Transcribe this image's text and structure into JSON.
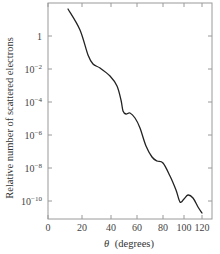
{
  "chart_data": {
    "type": "line",
    "title": "",
    "xlabel": "θ (degrees)",
    "xlabel_symbol": "θ",
    "xlabel_unit": "(degrees)",
    "ylabel": "Relative number of scattered electrons",
    "yscale": "log",
    "xscale": "nonlinear",
    "xlim": [
      0,
      125
    ],
    "ylim": [
      1e-11,
      100
    ],
    "grid": false,
    "legend": null,
    "x_ticks": [
      0,
      20,
      40,
      60,
      80,
      100,
      120
    ],
    "x_tick_labels": [
      "0",
      "20",
      "40",
      "60",
      "80",
      "100",
      "120"
    ],
    "x_tick_px": [
      48,
      82,
      111,
      137,
      163,
      184,
      202
    ],
    "y_ticks": [
      1,
      0.01,
      0.0001,
      1e-06,
      1e-08,
      1e-10
    ],
    "y_tick_labels": [
      {
        "base": "1",
        "exp": ""
      },
      {
        "base": "10",
        "exp": "−2"
      },
      {
        "base": "10",
        "exp": "−4"
      },
      {
        "base": "10",
        "exp": "−6"
      },
      {
        "base": "10",
        "exp": "−8"
      },
      {
        "base": "10",
        "exp": "−10"
      }
    ],
    "series": [
      {
        "name": "scattered electrons",
        "color": "#222222",
        "x": [
          12,
          18,
          22,
          25,
          30,
          36,
          42,
          45,
          47,
          49,
          52,
          56,
          60,
          64,
          69,
          73,
          80,
          85,
          90,
          95,
          100,
          104,
          110,
          116,
          120
        ],
        "log10_y": [
          1.64,
          0.36,
          -1.15,
          -1.7,
          -1.94,
          -2.42,
          -3.03,
          -3.88,
          -4.55,
          -4.73,
          -4.67,
          -4.97,
          -5.58,
          -6.67,
          -7.33,
          -7.58,
          -7.7,
          -8.48,
          -9.33,
          -10.06,
          -9.88,
          -9.64,
          -9.82,
          -10.36,
          -10.73
        ],
        "y": [
          43.6,
          2.3,
          0.071,
          0.02,
          0.0115,
          0.0038,
          0.00093,
          0.00013,
          2.8e-05,
          1.9e-05,
          2.1e-05,
          1.1e-05,
          2.6e-06,
          2.1e-07,
          4.7e-08,
          2.6e-08,
          2e-08,
          3.3e-09,
          4.7e-10,
          8.7e-11,
          1.3e-10,
          2.3e-10,
          1.5e-10,
          4.4e-11,
          1.9e-11
        ]
      }
    ],
    "curve_px": [
      [
        68,
        9
      ],
      [
        80,
        30
      ],
      [
        88,
        55
      ],
      [
        93,
        64
      ],
      [
        100,
        68
      ],
      [
        110,
        76
      ],
      [
        117,
        86
      ],
      [
        121,
        100
      ],
      [
        123,
        111
      ],
      [
        126,
        114
      ],
      [
        130,
        113
      ],
      [
        135,
        118
      ],
      [
        140,
        128
      ],
      [
        146,
        146
      ],
      [
        152,
        157
      ],
      [
        157,
        161
      ],
      [
        163,
        163
      ],
      [
        170,
        176
      ],
      [
        176,
        190
      ],
      [
        180,
        202
      ],
      [
        184,
        199
      ],
      [
        188,
        195
      ],
      [
        193,
        198
      ],
      [
        198,
        207
      ],
      [
        202,
        213
      ]
    ]
  },
  "colors": {
    "frame": "#9a9a9a",
    "curve": "#222222",
    "text": "#444444"
  }
}
